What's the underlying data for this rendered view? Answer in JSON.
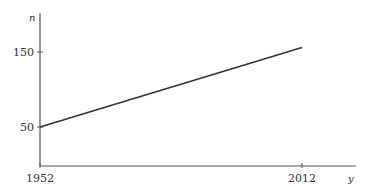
{
  "chart_data": {
    "type": "line",
    "title": "",
    "xlabel": "y",
    "ylabel": "n",
    "xlim": [
      1952,
      2022
    ],
    "ylim": [
      0,
      200
    ],
    "x_ticks": [
      1952,
      2012
    ],
    "y_ticks": [
      50,
      150
    ],
    "x_tick_labels": [
      "1952",
      "2012"
    ],
    "y_tick_labels": [
      "50",
      "150"
    ],
    "grid": false,
    "series": [
      {
        "name": "n",
        "x": [
          1952,
          2012
        ],
        "values": [
          50,
          156
        ],
        "color": "#333333"
      }
    ]
  }
}
